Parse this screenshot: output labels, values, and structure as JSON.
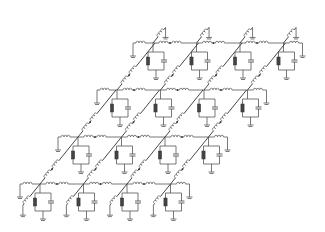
{
  "diagram": {
    "title": "",
    "type": "2D RLC lattice network",
    "rows": 4,
    "cols": 4,
    "colors": {
      "wire": "#555555",
      "diagonal": "#333333",
      "resistor": "#444444"
    },
    "rows_y": [
      43,
      90,
      137,
      184
    ],
    "row_x0": [
      153,
      117,
      78,
      40
    ],
    "col_spacing": 43.5,
    "elements_per_node": [
      "inductor-horizontal",
      "inductor-diagonal",
      "resistor",
      "capacitor",
      "ground"
    ]
  }
}
